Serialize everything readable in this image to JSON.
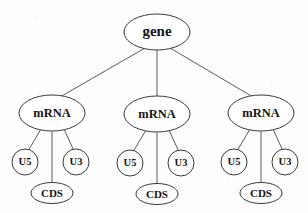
{
  "diagram": {
    "type": "tree",
    "colors": {
      "background": "#fdfdfd",
      "node_fill": "#ffffff",
      "node_stroke": "#3a3a3a",
      "edge_stroke": "#5a5a5a",
      "label_color": "#141414"
    },
    "root": {
      "label": "gene",
      "shape": "ellipse"
    },
    "branches": [
      {
        "label": "mRNA",
        "shape": "ellipse",
        "children": [
          {
            "label": "U5",
            "shape": "circle"
          },
          {
            "label": "CDS",
            "shape": "ellipse"
          },
          {
            "label": "U3",
            "shape": "circle"
          }
        ]
      },
      {
        "label": "mRNA",
        "shape": "ellipse",
        "children": [
          {
            "label": "U5",
            "shape": "circle"
          },
          {
            "label": "CDS",
            "shape": "ellipse"
          },
          {
            "label": "U3",
            "shape": "circle"
          }
        ]
      },
      {
        "label": "mRNA",
        "shape": "ellipse",
        "children": [
          {
            "label": "U5",
            "shape": "circle"
          },
          {
            "label": "CDS",
            "shape": "ellipse"
          },
          {
            "label": "U3",
            "shape": "circle"
          }
        ]
      }
    ]
  }
}
